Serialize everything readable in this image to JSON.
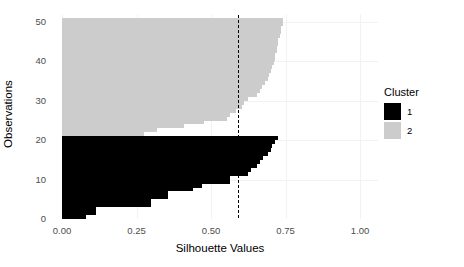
{
  "chart_data": {
    "type": "bar",
    "orientation": "horizontal",
    "title": "",
    "xlabel": "Silhouette Values",
    "ylabel": "Observations",
    "xlim": [
      0.0,
      1.06
    ],
    "ylim": [
      0,
      52
    ],
    "xticks": [
      0.0,
      0.25,
      0.5,
      0.75,
      1.0
    ],
    "xtick_labels": [
      "0.00",
      "0.25",
      "0.50",
      "0.75",
      "1.00"
    ],
    "yticks": [
      0,
      10,
      20,
      30,
      40,
      50
    ],
    "ytick_labels": [
      "0",
      "10",
      "20",
      "30",
      "40",
      "50"
    ],
    "grid": true,
    "legend_position": "right",
    "average_silhouette_width": 0.59,
    "annotations": [
      {
        "type": "vline",
        "value": 0.59,
        "style": "dashed",
        "color": "#000000"
      }
    ],
    "legend": {
      "title": "Cluster",
      "entries": [
        {
          "label": "1",
          "color": "#000000"
        },
        {
          "label": "2",
          "color": "#cccccc"
        }
      ]
    },
    "series": [
      {
        "name": "1",
        "cluster": "1",
        "color": "#000000",
        "observations": [
          1,
          2,
          3,
          4,
          5,
          6,
          7,
          8,
          9,
          10,
          11,
          12,
          13,
          14,
          15,
          16,
          17,
          18,
          19,
          20,
          21
        ],
        "values": [
          0.08,
          0.115,
          0.115,
          0.3,
          0.3,
          0.355,
          0.355,
          0.44,
          0.47,
          0.565,
          0.565,
          0.625,
          0.635,
          0.655,
          0.665,
          0.675,
          0.69,
          0.7,
          0.705,
          0.715,
          0.725
        ]
      },
      {
        "name": "2",
        "cluster": "2",
        "color": "#cccccc",
        "observations": [
          22,
          23,
          24,
          25,
          26,
          27,
          28,
          29,
          30,
          31,
          32,
          33,
          34,
          35,
          36,
          37,
          38,
          39,
          40,
          41,
          42,
          43,
          44,
          45,
          46,
          47,
          48,
          49,
          50,
          51
        ],
        "values": [
          0.275,
          0.32,
          0.41,
          0.475,
          0.555,
          0.565,
          0.585,
          0.605,
          0.61,
          0.625,
          0.655,
          0.665,
          0.67,
          0.68,
          0.69,
          0.695,
          0.7,
          0.705,
          0.71,
          0.715,
          0.715,
          0.72,
          0.72,
          0.725,
          0.725,
          0.73,
          0.735,
          0.735,
          0.74,
          0.74
        ]
      }
    ]
  }
}
